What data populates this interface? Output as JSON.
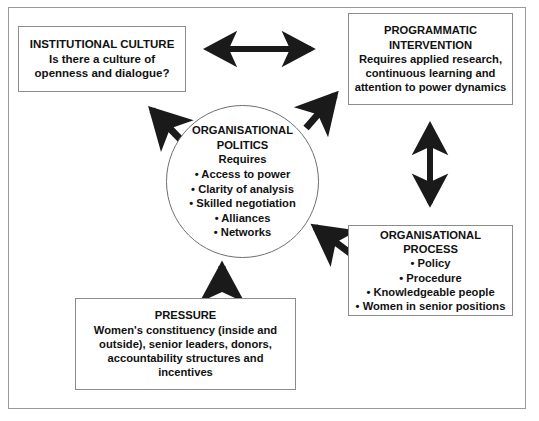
{
  "diagram": {
    "frame": {
      "border_color": "#9b9b9b",
      "background": "#ffffff"
    },
    "text_color": "#111111",
    "arrow_color": "#1a1a1a",
    "nodes": {
      "institutional_culture": {
        "name": "Institutional Culture",
        "heading": "INSTITUTIONAL CULTURE",
        "lines": [
          "Is there a culture of",
          "openness and dialogue?"
        ]
      },
      "programmatic_intervention": {
        "name": "Programmatic Intervention",
        "heading_lines": [
          "PROGRAMMATIC",
          "INTERVENTION"
        ],
        "lines": [
          "Requires applied research,",
          "continuous learning and",
          "attention to power dynamics"
        ]
      },
      "organisational_politics": {
        "name": "Organisational Politics",
        "heading_lines": [
          "ORGANISATIONAL",
          "POLITICS"
        ],
        "subheading": "Requires",
        "lines": [
          "• Access to power",
          "• Clarity of analysis",
          "• Skilled negotiation",
          "• Alliances",
          "• Networks"
        ]
      },
      "organisational_process": {
        "name": "Organisational Process",
        "heading_lines": [
          "ORGANISATIONAL",
          "PROCESS"
        ],
        "lines": [
          "• Policy",
          "• Procedure",
          "• Knowledgeable people",
          "• Women in senior positions"
        ]
      },
      "pressure": {
        "name": "Pressure",
        "heading": "PRESSURE",
        "lines": [
          "Women's constituency (inside and",
          "outside), senior leaders, donors,",
          "accountability structures and",
          "incentives"
        ]
      }
    },
    "arrows": [
      {
        "id": "culture-intervention",
        "label": "horizontal double-headed arrow between institutional culture and programmatic intervention",
        "style": "double-headed",
        "direction": "horizontal"
      },
      {
        "id": "intervention-process",
        "label": "vertical double-headed arrow between programmatic intervention and organisational process",
        "style": "double-headed",
        "direction": "vertical"
      },
      {
        "id": "politics-to-culture",
        "label": "diagonal arrow from organisational politics to institutional culture",
        "style": "single-headed",
        "direction": "up-left"
      },
      {
        "id": "politics-to-intervention",
        "label": "diagonal arrow from organisational politics to programmatic intervention",
        "style": "single-headed",
        "direction": "up-right"
      },
      {
        "id": "process-to-politics",
        "label": "diagonal arrow from organisational process to organisational politics",
        "style": "single-headed",
        "direction": "down-left"
      },
      {
        "id": "pressure-to-politics",
        "label": "vertical arrow from pressure to organisational politics",
        "style": "single-headed",
        "direction": "up"
      }
    ]
  }
}
